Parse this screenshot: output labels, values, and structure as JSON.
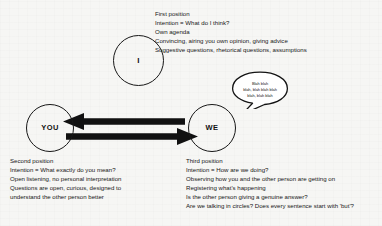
{
  "diagram": {
    "background_color": "#f6f6f4",
    "ink_color": "#171717",
    "nodes": {
      "i": {
        "label": "I"
      },
      "you": {
        "label": "YOU"
      },
      "we": {
        "label": "WE"
      }
    },
    "arrows": [
      {
        "name": "arrow-we-to-you",
        "direction": "left",
        "from": "WE",
        "to": "YOU"
      },
      {
        "name": "arrow-you-to-we",
        "direction": "right",
        "from": "YOU",
        "to": "WE"
      }
    ],
    "speech_bubble": {
      "lines": [
        "Blah blah",
        "blah, blah blah blah",
        "blah, blah blah"
      ]
    },
    "blocks": {
      "first_position": {
        "heading": "First position",
        "lines": [
          "First position",
          "Intention = What do I think?",
          "Own agenda",
          "Convincing, airing you own opinion, giving advice",
          "Suggestive questions, rhetorical questions, assumptions"
        ]
      },
      "second_position": {
        "heading": "Second position",
        "lines": [
          "Second position",
          "Intention = What exactly do you mean?",
          "Open listening, no personal interpretation",
          "Questions are open, curious, designed to",
          "understand the other person better"
        ]
      },
      "third_position": {
        "heading": "Third position",
        "lines": [
          "Third position",
          "Intention = How are we doing?",
          "Observing how you and the other person are getting on",
          "Registering what's happening",
          "Is the other person giving a genuine answer?",
          "Are we talking in circles? Does every sentence start with 'but'?"
        ]
      }
    }
  }
}
